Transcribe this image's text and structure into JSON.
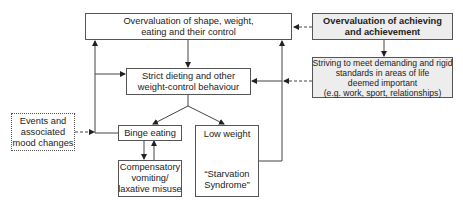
{
  "diagram": {
    "nodes": {
      "overvaluation_shape": {
        "lines": [
          "Overvaluation of shape, weight,",
          "eating and their control"
        ]
      },
      "overvaluation_achieving": {
        "lines": [
          "Overvaluation of achieving",
          "and achievement"
        ]
      },
      "striving": {
        "lines": [
          "Striving to meet demanding and rigid",
          "standards in areas of life",
          "deemed important",
          "(e.g. work, sport, relationships)"
        ]
      },
      "strict_dieting": {
        "lines": [
          "Strict dieting and other",
          "weight-control behaviour"
        ]
      },
      "binge_eating": {
        "lines": [
          "Binge eating"
        ]
      },
      "compensatory": {
        "lines": [
          "Compensatory",
          "vomiting/",
          "laxative misuse"
        ]
      },
      "low_weight": {
        "title": "Low weight",
        "lines": [
          "“Starvation",
          "Syndrome”"
        ]
      },
      "events": {
        "lines": [
          "Events and",
          "associated",
          "mood changes"
        ]
      }
    },
    "colors": {
      "stroke": "#555555",
      "highlight_fill": "#ededed"
    }
  }
}
